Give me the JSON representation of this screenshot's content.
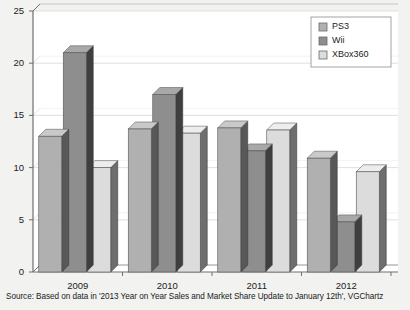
{
  "chart_data": {
    "type": "bar",
    "title": "",
    "xlabel": "",
    "ylabel": "",
    "categories": [
      "2009",
      "2010",
      "2011",
      "2012"
    ],
    "series": [
      {
        "name": "PS3",
        "values": [
          13.0,
          13.7,
          13.8,
          10.9
        ],
        "color": "#b0b0b0"
      },
      {
        "name": "Wii",
        "values": [
          21.0,
          17.0,
          11.6,
          4.8
        ],
        "color": "#8e8e8e"
      },
      {
        "name": "XBox360",
        "values": [
          10.0,
          13.3,
          13.6,
          9.6
        ],
        "color": "#dcdcdc"
      }
    ],
    "ylim": [
      0,
      25
    ],
    "yticks": [
      0,
      5,
      10,
      15,
      20,
      25
    ],
    "grid": true,
    "legend_position": "top-right",
    "three_d": true
  },
  "caption": {
    "source_text": "Source: Based on data in '2013 Year on Year Sales and Market Share Update to January 12th', VGChartz"
  },
  "colors": {
    "background": "#f2f2f0",
    "plot_background": "#ffffff",
    "gridline": "#d8d8d8",
    "axis": "#6e6e6e",
    "text": "#1b1b1b",
    "legend_border": "#9a9a9a",
    "side_face": "#4f4f4f",
    "top_face_ps3": "#c9c9c9",
    "top_face_wii": "#a8a8a8",
    "top_face_xbox": "#ededed"
  }
}
